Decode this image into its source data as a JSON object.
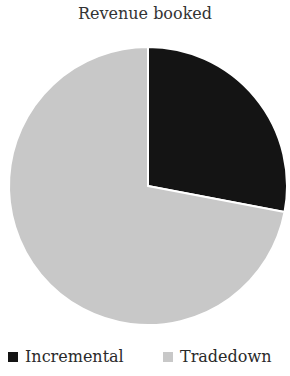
{
  "chart_data": {
    "type": "pie",
    "title": "Revenue booked",
    "categories": [
      "Incremental",
      "Tradedown"
    ],
    "values": [
      28,
      72
    ],
    "colors": [
      "#141414",
      "#c8c8c8"
    ],
    "start_angle_deg": 0,
    "direction": "clockwise",
    "legend_position": "bottom"
  },
  "legend": {
    "items": [
      {
        "label": "Incremental",
        "color": "#141414"
      },
      {
        "label": "Tradedown",
        "color": "#c8c8c8"
      }
    ]
  }
}
